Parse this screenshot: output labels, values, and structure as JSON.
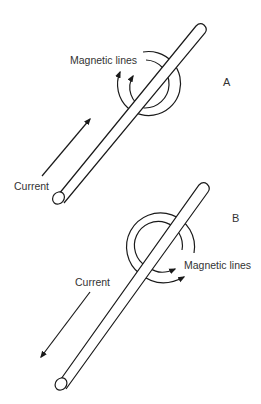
{
  "diagram": {
    "panels": [
      {
        "id": "A",
        "label": "A",
        "field_label": "Magnetic lines",
        "current_label": "Current",
        "current_direction": "up-right",
        "field_direction": "counter-clockwise"
      },
      {
        "id": "B",
        "label": "B",
        "field_label": "Magnetic lines",
        "current_label": "Current",
        "current_direction": "down-left",
        "field_direction": "clockwise"
      }
    ]
  },
  "colors": {
    "line": "#1a1a1a",
    "text": "#333333",
    "background": "#ffffff"
  }
}
